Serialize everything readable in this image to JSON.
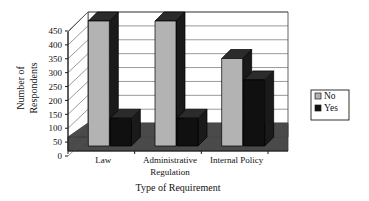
{
  "chart_data": {
    "type": "bar",
    "title": "",
    "subtitle": "",
    "xlabel": "Type of Requirement",
    "ylabel": "Number of Respondents",
    "ylabel_line1": "Number of",
    "ylabel_line2": "Respondents",
    "categories": [
      "Law",
      "Administrative Regulation",
      "Internal Policy"
    ],
    "category_lines": [
      [
        "Law"
      ],
      [
        "Administrative",
        "Regulation"
      ],
      [
        "Internal Policy"
      ]
    ],
    "series": [
      {
        "name": "No",
        "values": [
          450,
          450,
          315
        ],
        "color": "#b3b3b3"
      },
      {
        "name": "Yes",
        "values": [
          100,
          100,
          238
        ],
        "color": "#101010"
      }
    ],
    "ylim": [
      0,
      450
    ],
    "ytick_labels": [
      "0",
      "50",
      "100",
      "150",
      "200",
      "250",
      "300",
      "350",
      "400",
      "450"
    ],
    "ytick_values": [
      0,
      50,
      100,
      150,
      200,
      250,
      300,
      350,
      400,
      450
    ],
    "grid": true,
    "grid_axis": "y",
    "legend": {
      "position": "right",
      "entries": [
        {
          "label": "No",
          "swatch_color": "#b3b3b3"
        },
        {
          "label": "Yes",
          "swatch_color": "#101010"
        }
      ]
    },
    "style": {
      "three_d": true,
      "floor_color": "#4a4a4a",
      "wall_color": "#ffffff",
      "axis_color": "#222222",
      "grid_color": "#555555",
      "bar_top_color": "#2b2b2b",
      "bar_side_color": "#1a1a1a",
      "gray_bar_face": "#b3b3b3",
      "black_bar_face": "#101010",
      "background": "#ffffff"
    }
  }
}
